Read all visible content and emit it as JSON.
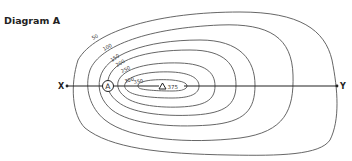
{
  "title": "Diagram A",
  "section": {
    "start_label": "X",
    "end_label": "Y"
  },
  "point": {
    "label": "A"
  },
  "summit": {
    "symbol": "triangle",
    "height": "375"
  },
  "contours": [
    {
      "value": "50"
    },
    {
      "value": "100"
    },
    {
      "value": "150"
    },
    {
      "value": "200"
    },
    {
      "value": "250"
    },
    {
      "value": "300"
    },
    {
      "value": "350"
    }
  ],
  "colors": {
    "line": "#555555",
    "text": "#222222",
    "background": "#ffffff"
  }
}
